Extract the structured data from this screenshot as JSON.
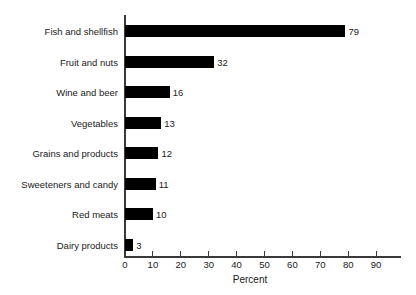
{
  "chart_data": {
    "type": "bar",
    "orientation": "horizontal",
    "title": "",
    "subtitle": "",
    "xlabel": "Percent",
    "ylabel": "",
    "xlim": [
      0,
      90
    ],
    "xticks": [
      0,
      10,
      20,
      30,
      40,
      50,
      60,
      70,
      80,
      90
    ],
    "xtick_labels": [
      "0",
      "10",
      "20",
      "30",
      "40",
      "50",
      "60",
      "70",
      "80",
      "90"
    ],
    "grid": false,
    "legend": null,
    "bar_color": "#000000",
    "axis_color": "#3a3a3a",
    "text_color": "#1a1a1a",
    "categories": [
      "Fish and shellfish",
      "Fruit and nuts",
      "Wine and beer",
      "Vegetables",
      "Grains and products",
      "Sweeteners and candy",
      "Red meats",
      "Dairy products"
    ],
    "values": [
      79,
      32,
      16,
      13,
      12,
      11,
      10,
      3
    ],
    "value_labels": [
      "79",
      "32",
      "16",
      "13",
      "12",
      "11",
      "10",
      "3"
    ]
  }
}
